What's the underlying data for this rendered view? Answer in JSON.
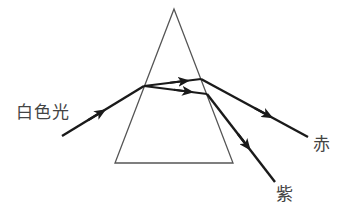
{
  "labels": {
    "white_light": "白色光",
    "red": "赤",
    "violet": "紫"
  },
  "colors": {
    "ray": "#1a1a1a",
    "prism": "#555555",
    "text": "#444444",
    "background": "#ffffff"
  },
  "geometry": {
    "prism": {
      "apex": [
        174,
        9
      ],
      "base_left": [
        115,
        163
      ],
      "base_right": [
        233,
        163
      ]
    },
    "incident_ray": {
      "from": [
        62,
        136
      ],
      "to": [
        144,
        86
      ]
    },
    "red_inside": {
      "from": [
        144,
        86
      ],
      "to": [
        201,
        79
      ]
    },
    "red_outside": {
      "from": [
        201,
        79
      ],
      "to": [
        308,
        137
      ]
    },
    "violet_inside": {
      "from": [
        144,
        86
      ],
      "to": [
        207,
        94
      ]
    },
    "violet_outside": {
      "from": [
        207,
        94
      ],
      "to": [
        275,
        182
      ]
    }
  }
}
